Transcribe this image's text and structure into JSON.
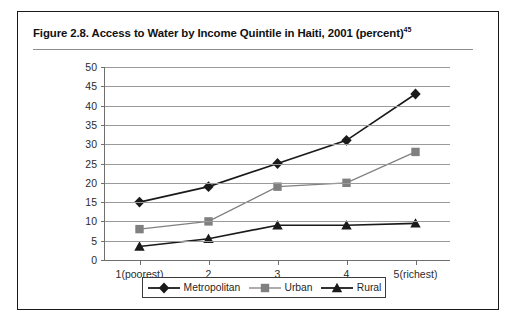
{
  "figure": {
    "title_text": "Figure 2.8.  Access to Water by Income Quintile in Haiti, 2001 (percent)",
    "title_superscript": "45"
  },
  "chart_data": {
    "type": "line",
    "title": "Figure 2.8.  Access to Water by Income Quintile in Haiti, 2001 (percent)",
    "xlabel": "",
    "ylabel": "",
    "categories": [
      "1(poorest)",
      "2",
      "3",
      "4",
      "5(richest)"
    ],
    "series": [
      {
        "name": "Metropolitan",
        "marker": "diamond",
        "color": "#1a1a1a",
        "values": [
          15,
          19,
          25,
          31,
          43
        ]
      },
      {
        "name": "Urban",
        "marker": "square",
        "color": "#808080",
        "values": [
          8,
          10,
          19,
          20,
          28
        ]
      },
      {
        "name": "Rural",
        "marker": "triangle",
        "color": "#1a1a1a",
        "values": [
          3.5,
          5.5,
          9,
          9,
          9.5
        ]
      }
    ],
    "ylim": [
      0,
      50
    ],
    "ytick_labels": [
      "0",
      "5",
      "10",
      "15",
      "20",
      "25",
      "30",
      "35",
      "40",
      "45",
      "50"
    ],
    "ytick_values": [
      0,
      5,
      10,
      15,
      20,
      25,
      30,
      35,
      40,
      45,
      50
    ],
    "grid": true,
    "legend_position": "bottom"
  },
  "legend": {
    "items": [
      {
        "label": "Metropolitan"
      },
      {
        "label": "Urban"
      },
      {
        "label": "Rural"
      }
    ]
  }
}
